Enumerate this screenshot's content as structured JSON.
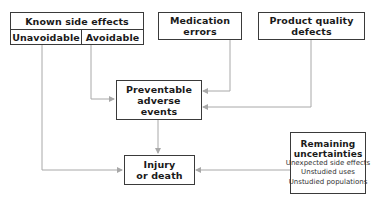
{
  "diagram": {
    "nodes": {
      "known_side_effects": {
        "title": "Known side effects",
        "children": [
          "Unavoidable",
          "Avoidable"
        ]
      },
      "medication_errors": {
        "line1": "Medication",
        "line2": "errors"
      },
      "product_quality_defects": {
        "line1": "Product quality",
        "line2": "defects"
      },
      "preventable_adverse_events": {
        "line1": "Preventable",
        "line2": "adverse",
        "line3": "events"
      },
      "injury_or_death": {
        "line1": "Injury",
        "line2": "or death"
      },
      "remaining_uncertainties": {
        "title1": "Remaining",
        "title2": "uncertainties",
        "items": [
          "Unexpected side effects",
          "Unstudied uses",
          "Unstudied populations"
        ]
      }
    },
    "edges": [
      {
        "from": "Unavoidable",
        "to": "Injury or death"
      },
      {
        "from": "Avoidable",
        "to": "Preventable adverse events"
      },
      {
        "from": "Medication errors",
        "to": "Preventable adverse events"
      },
      {
        "from": "Product quality defects",
        "to": "Preventable adverse events"
      },
      {
        "from": "Preventable adverse events",
        "to": "Injury or death"
      },
      {
        "from": "Remaining uncertainties",
        "to": "Injury or death"
      }
    ],
    "colors": {
      "border": "#3a3a3a",
      "connector": "#a8a8a8"
    }
  }
}
